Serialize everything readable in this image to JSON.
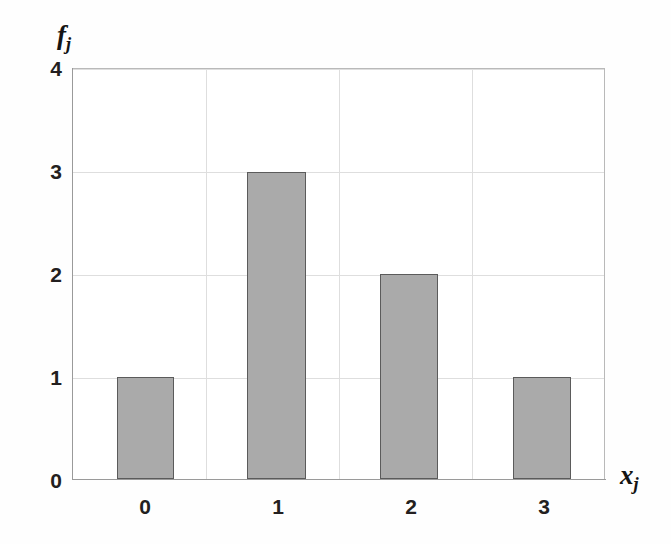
{
  "chart_data": {
    "type": "bar",
    "title": "",
    "subtitle": "",
    "categories": [
      "0",
      "1",
      "2",
      "3"
    ],
    "values": [
      1,
      3,
      2,
      1
    ],
    "series": [
      {
        "name": "f_j",
        "values": [
          1,
          3,
          2,
          1
        ]
      }
    ],
    "xlabel": "x",
    "xlabel_sub": "j",
    "ylabel": "f",
    "ylabel_sub": "j",
    "ylim": [
      0,
      4
    ],
    "yticks": [
      "4",
      "3",
      "2",
      "1",
      "0"
    ],
    "ytick_values": [
      4,
      3,
      2,
      1,
      0
    ],
    "xticks": [
      "0",
      "1",
      "2",
      "3"
    ],
    "grid": true,
    "grid_axis": "both",
    "legend": false,
    "legend_position": "none",
    "annotations": []
  },
  "style": {
    "bar_fill": "#aaaaaa",
    "bar_border": "#5b5b5b",
    "grid_color": "#dedede",
    "axis_color": "#9a9a9a",
    "text_color": "#231f20",
    "background": "#fefefe"
  },
  "axis": {
    "y_title": "f",
    "y_title_sub": "j",
    "x_title": "x",
    "x_title_sub": "j"
  }
}
